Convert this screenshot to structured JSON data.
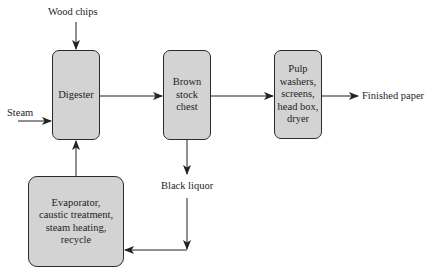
{
  "diagram": {
    "type": "process-flow",
    "nodes": {
      "digester": {
        "label": "Digester"
      },
      "brown_stock_chest": {
        "label": "Brown\nstock\nchest"
      },
      "pulp_processing": {
        "label": "Pulp\nwashers,\nscreens,\nhead box,\ndryer"
      },
      "evaporator": {
        "label": "Evaporator,\ncaustic treatment,\nsteam heating,\nrecycle"
      }
    },
    "inputs": {
      "wood_chips": "Wood chips",
      "steam": "Steam"
    },
    "outputs": {
      "finished_paper": "Finished paper",
      "black_liquor": "Black liquor"
    },
    "edges": [
      {
        "from": "Wood chips",
        "to": "Digester"
      },
      {
        "from": "Steam",
        "to": "Digester"
      },
      {
        "from": "Digester",
        "to": "Brown stock chest"
      },
      {
        "from": "Brown stock chest",
        "to": "Pulp washers, screens, head box, dryer"
      },
      {
        "from": "Pulp washers, screens, head box, dryer",
        "to": "Finished paper"
      },
      {
        "from": "Brown stock chest",
        "to": "Black liquor"
      },
      {
        "from": "Black liquor",
        "to": "Evaporator, caustic treatment, steam heating, recycle"
      },
      {
        "from": "Evaporator, caustic treatment, steam heating, recycle",
        "to": "Digester"
      }
    ],
    "colors": {
      "box_fill": "#d3d3d3",
      "box_border": "#2b2b2b",
      "line": "#222222"
    }
  }
}
